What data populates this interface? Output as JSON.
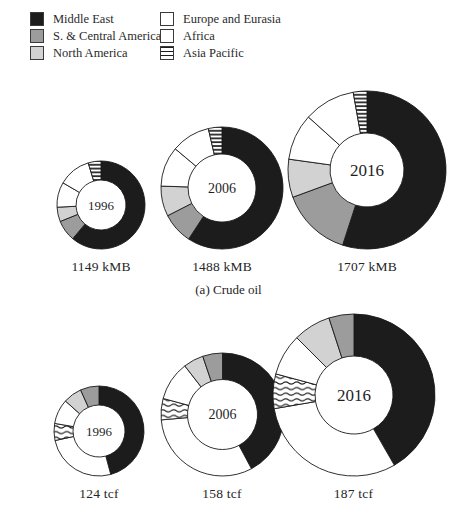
{
  "figure": {
    "background": "#ffffff"
  },
  "legend": {
    "position": "top",
    "items": [
      {
        "label": "Middle East",
        "swatch": "solid",
        "color": "#1c1c1c"
      },
      {
        "label": "S. & Central America",
        "swatch": "solid",
        "color": "#9c9c9c"
      },
      {
        "label": "North America",
        "swatch": "solid",
        "color": "#d2d2d2"
      },
      {
        "label": "Europe and Eurasia",
        "swatch": "solid",
        "color": "#ffffff"
      },
      {
        "label": "Africa",
        "swatch": "solid",
        "color": "#ffffff"
      },
      {
        "label": "Asia Pacific",
        "swatch": "hatch-horizontal",
        "color": "#1c1c1c"
      }
    ]
  },
  "chart_data": [
    {
      "type": "pie",
      "variant": "donut",
      "caption": "(a) Crude oil",
      "unit": "kMB",
      "asia_pacific_hatch": "stripes",
      "segment_order_note": "segments listed clockwise from 12 o'clock",
      "donuts": [
        {
          "year": "1996",
          "total": 1149,
          "total_label": "1149 kMB",
          "outer_px": 88,
          "inner_px": 50,
          "segments": [
            {
              "region": "Middle East",
              "pct": 61.1
            },
            {
              "region": "S. & Central America",
              "pct": 7.8
            },
            {
              "region": "North America",
              "pct": 5.3
            },
            {
              "region": "Europe and Eurasia",
              "pct": 9.2
            },
            {
              "region": "Africa",
              "pct": 11.9
            },
            {
              "region": "Asia Pacific",
              "pct": 4.7
            }
          ]
        },
        {
          "year": "2006",
          "total": 1488,
          "total_label": "1488 kMB",
          "outer_px": 122,
          "inner_px": 68,
          "segments": [
            {
              "region": "Middle East",
              "pct": 59.2
            },
            {
              "region": "S. & Central America",
              "pct": 8.3
            },
            {
              "region": "North America",
              "pct": 8.0
            },
            {
              "region": "Europe and Eurasia",
              "pct": 10.6
            },
            {
              "region": "Africa",
              "pct": 10.3
            },
            {
              "region": "Asia Pacific",
              "pct": 3.6
            }
          ]
        },
        {
          "year": "2016",
          "total": 1707,
          "total_label": "1707 kMB",
          "outer_px": 158,
          "inner_px": 74,
          "segments": [
            {
              "region": "Middle East",
              "pct": 55.0
            },
            {
              "region": "S. & Central America",
              "pct": 14.4
            },
            {
              "region": "North America",
              "pct": 7.8
            },
            {
              "region": "Europe and Eurasia",
              "pct": 9.5
            },
            {
              "region": "Africa",
              "pct": 10.5
            },
            {
              "region": "Asia Pacific",
              "pct": 2.8
            }
          ]
        }
      ]
    },
    {
      "type": "pie",
      "variant": "donut",
      "caption": "(b) Natural gas",
      "unit": "tcf",
      "asia_pacific_hatch": "waves",
      "segment_order_note": "segments listed clockwise from 12 o'clock",
      "donuts": [
        {
          "year": "1996",
          "total": 124,
          "total_label": "124 tcf",
          "outer_px": 90,
          "inner_px": 52,
          "segments": [
            {
              "region": "Middle East",
              "pct": 45.8
            },
            {
              "region": "Europe and Eurasia",
              "pct": 25.8
            },
            {
              "region": "Asia Pacific",
              "pct": 6.1
            },
            {
              "region": "Africa",
              "pct": 8.9
            },
            {
              "region": "North America",
              "pct": 6.7
            },
            {
              "region": "S. & Central America",
              "pct": 6.7
            }
          ]
        },
        {
          "year": "2006",
          "total": 158,
          "total_label": "158 tcf",
          "outer_px": 123,
          "inner_px": 70,
          "segments": [
            {
              "region": "Middle East",
              "pct": 42.2
            },
            {
              "region": "Europe and Eurasia",
              "pct": 31.4
            },
            {
              "region": "Asia Pacific",
              "pct": 5.6
            },
            {
              "region": "Africa",
              "pct": 10.3
            },
            {
              "region": "North America",
              "pct": 5.3
            },
            {
              "region": "S. & Central America",
              "pct": 5.2
            }
          ]
        },
        {
          "year": "2016",
          "total": 187,
          "total_label": "187 tcf",
          "outer_px": 162,
          "inner_px": 78,
          "segments": [
            {
              "region": "Middle East",
              "pct": 41.7
            },
            {
              "region": "Europe and Eurasia",
              "pct": 30.6
            },
            {
              "region": "Asia Pacific",
              "pct": 6.9
            },
            {
              "region": "Africa",
              "pct": 8.3
            },
            {
              "region": "North America",
              "pct": 7.5
            },
            {
              "region": "S. & Central America",
              "pct": 5.0
            }
          ]
        }
      ]
    }
  ]
}
